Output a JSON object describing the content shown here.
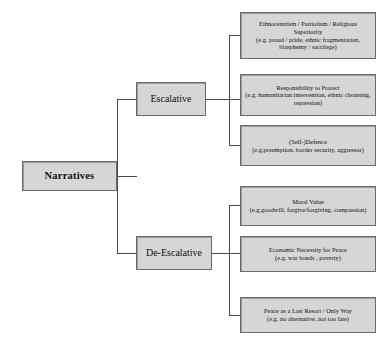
{
  "diagram": {
    "type": "tree",
    "orientation": "left-to-right",
    "title_text": "",
    "colors": {
      "node_fill": "#d6d6d6",
      "node_border": "#6b6b6b",
      "connector": "#4a4a4a",
      "background": "#ffffff",
      "text": "#111111"
    },
    "root": {
      "label": "Narratives"
    },
    "branches": [
      {
        "label": "Escalative",
        "children": [
          {
            "title": "Ethnocentrism / Patriotism / Religious Superiority",
            "example": "(e.g. proud / pride, ethnic fragmentation, blasphemy / sacrilege)"
          },
          {
            "title": "Responsibility to Protect",
            "example": "(e.g. humanitarian intervention, ethnic cleansing, repression)"
          },
          {
            "title": "(Self-)Defence",
            "example": "(e.g.preemption, border security, aggressor)"
          }
        ]
      },
      {
        "label": "De-Escalative",
        "children": [
          {
            "title": "Moral Value",
            "example": "(e.g.goodwill, forgive/forgiving, compassion)"
          },
          {
            "title": "Economic Necessity for Peace",
            "example": "(e.g. war bonds , poverty)"
          },
          {
            "title": "Peace as a Last Resort / Only Way",
            "example": "(e.g. no alternative, not too late)"
          }
        ]
      }
    ]
  }
}
